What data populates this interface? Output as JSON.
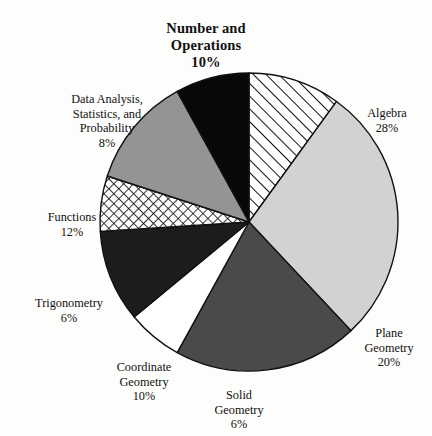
{
  "title": {
    "line1": "Number and",
    "line2": "Operations",
    "line3": "10%"
  },
  "labels": {
    "algebra": {
      "name": "Algebra",
      "pct": "28%"
    },
    "plane_geometry": {
      "name": "Plane\nGeometry",
      "pct": "20%"
    },
    "solid_geometry": {
      "name": "Solid\nGeometry",
      "pct": "6%"
    },
    "coordinate_geometry": {
      "name": "Coordinate\nGeometry",
      "pct": "10%"
    },
    "trigonometry": {
      "name": "Trigonometry",
      "pct": "6%"
    },
    "functions": {
      "name": "Functions",
      "pct": "12%"
    },
    "data_analysis": {
      "name": "Data Analysis,\nStatistics, and\nProbability",
      "pct": "8%"
    }
  },
  "chart_data": {
    "type": "pie",
    "title": "Number and Operations 10%",
    "xlabel": "",
    "ylabel": "",
    "legend": "none",
    "grid": false,
    "start_angle_deg": 0,
    "direction": "clockwise",
    "center": {
      "x": 249,
      "y": 222
    },
    "radius": 149,
    "categories": [
      "Number and Operations",
      "Algebra",
      "Plane Geometry",
      "Solid Geometry",
      "Coordinate Geometry",
      "Trigonometry",
      "Functions",
      "Data Analysis, Statistics, and Probability"
    ],
    "values": [
      10,
      28,
      20,
      6,
      10,
      6,
      12,
      8
    ],
    "value_labels": [
      "10%",
      "28%",
      "20%",
      "6%",
      "10%",
      "6%",
      "12%",
      "8%"
    ],
    "slices": [
      {
        "label": "Number and Operations",
        "value": 10,
        "value_label": "10%",
        "fill": "diagonal-hatch",
        "color": "#ffffff",
        "stroke": "#111111"
      },
      {
        "label": "Algebra",
        "value": 28,
        "value_label": "28%",
        "fill": "solid",
        "color": "#d2d2d2",
        "stroke": "#111111"
      },
      {
        "label": "Plane Geometry",
        "value": 20,
        "value_label": "20%",
        "fill": "solid",
        "color": "#4a4a4a",
        "stroke": "#111111"
      },
      {
        "label": "Solid Geometry",
        "value": 6,
        "value_label": "6%",
        "fill": "solid",
        "color": "#ffffff",
        "stroke": "#111111"
      },
      {
        "label": "Coordinate Geometry",
        "value": 10,
        "value_label": "10%",
        "fill": "solid",
        "color": "#1c1c1c",
        "stroke": "#111111"
      },
      {
        "label": "Trigonometry",
        "value": 6,
        "value_label": "6%",
        "fill": "cross-hatch",
        "color": "#ffffff",
        "stroke": "#111111"
      },
      {
        "label": "Functions",
        "value": 12,
        "value_label": "12%",
        "fill": "solid",
        "color": "#949494",
        "stroke": "#111111"
      },
      {
        "label": "Data Analysis, Statistics, and Probability",
        "value": 8,
        "value_label": "8%",
        "fill": "solid",
        "color": "#080808",
        "stroke": "#111111"
      }
    ],
    "total": 100,
    "units": "percent"
  },
  "colors": {
    "background": "#fdfdfc",
    "outline": "#111111",
    "text": "#111111"
  }
}
